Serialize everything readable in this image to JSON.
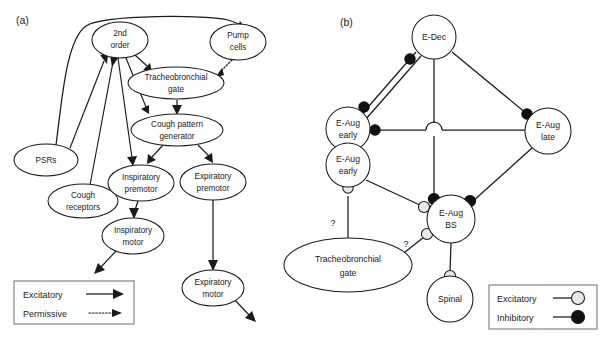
{
  "figure": {
    "panels": [
      {
        "id": "a",
        "label": "(a)"
      },
      {
        "id": "b",
        "label": "(b)"
      }
    ]
  },
  "panel_a": {
    "label": "(a)",
    "nodes": [
      {
        "id": "second_order",
        "label_line1": "2nd",
        "label_line2": "order",
        "cx": 120,
        "cy": 40,
        "rx": 28,
        "ry": 18
      },
      {
        "id": "pump_cells",
        "label_line1": "Pump",
        "label_line2": "cells",
        "cx": 238,
        "cy": 42,
        "rx": 28,
        "ry": 18
      },
      {
        "id": "tracheobronchial_gate",
        "label_line1": "Tracheobronchial",
        "label_line2": "gate",
        "cx": 176,
        "cy": 83,
        "rx": 48,
        "ry": 16
      },
      {
        "id": "cough_pattern_gen",
        "label_line1": "Cough pattern",
        "label_line2": "generator",
        "cx": 177,
        "cy": 130,
        "rx": 46,
        "ry": 16
      },
      {
        "id": "psrs",
        "label_line1": "PSRs",
        "label_line2": "",
        "cx": 46,
        "cy": 160,
        "rx": 32,
        "ry": 16
      },
      {
        "id": "cough_receptors",
        "label_line1": "Cough",
        "label_line2": "receptors",
        "cx": 83,
        "cy": 201,
        "rx": 35,
        "ry": 17
      },
      {
        "id": "inspiratory_premotor",
        "label_line1": "Inspiratory",
        "label_line2": "premotor",
        "cx": 141,
        "cy": 183,
        "rx": 33,
        "ry": 18
      },
      {
        "id": "expiratory_premotor",
        "label_line1": "Expiratory",
        "label_line2": "premotor",
        "cx": 213,
        "cy": 182,
        "rx": 33,
        "ry": 18
      },
      {
        "id": "inspiratory_motor",
        "label_line1": "Inspiratory",
        "label_line2": "motor",
        "cx": 133,
        "cy": 236,
        "rx": 31,
        "ry": 18
      },
      {
        "id": "expiratory_motor",
        "label_line1": "Expiratory",
        "label_line2": "motor",
        "cx": 213,
        "cy": 288,
        "rx": 31,
        "ry": 18
      }
    ],
    "legend": {
      "items": [
        {
          "id": "excitatory",
          "label": "Excitatory",
          "style": "solid-arrow"
        },
        {
          "id": "permissive",
          "label": "Permissive",
          "style": "dotted-arrow"
        }
      ]
    }
  },
  "panel_b": {
    "label": "(b)",
    "nodes": [
      {
        "id": "e_dec",
        "label_line1": "E-Dec",
        "label_line2": "",
        "cx": 434,
        "cy": 37,
        "r": 22
      },
      {
        "id": "e_aug_early_upper",
        "label_line1": "E-Aug",
        "label_line2": "early",
        "cx": 348,
        "cy": 129,
        "r": 22
      },
      {
        "id": "e_aug_early_lower",
        "label_line1": "E-Aug",
        "label_line2": "early",
        "cx": 348,
        "cy": 165,
        "r": 22
      },
      {
        "id": "e_aug_late",
        "label_line1": "E-Aug",
        "label_line2": "late",
        "cx": 548,
        "cy": 131,
        "r": 23
      },
      {
        "id": "e_aug_bs",
        "label_line1": "E-Aug",
        "label_line2": "BS",
        "cx": 451,
        "cy": 219,
        "r": 24
      },
      {
        "id": "spinal",
        "label_line1": "Spinal",
        "label_line2": "",
        "cx": 450,
        "cy": 299,
        "r": 23
      }
    ],
    "ellipse_nodes": [
      {
        "id": "tracheobronchial_gate_b",
        "label_line1": "Tracheobronchial",
        "label_line2": "gate",
        "cx": 348,
        "cy": 265,
        "rx": 64,
        "ry": 27
      }
    ],
    "annotations": [
      {
        "id": "q1",
        "label": "?",
        "x": 333,
        "y": 222
      },
      {
        "id": "q2",
        "label": "?",
        "x": 405,
        "y": 243
      }
    ],
    "legend": {
      "items": [
        {
          "id": "excitatory",
          "label": "Excitatory",
          "marker": "open-circle",
          "color": "#e8e8e8"
        },
        {
          "id": "inhibitory",
          "label": "Inhibitory",
          "marker": "filled-circle",
          "color": "#111111"
        }
      ]
    }
  }
}
